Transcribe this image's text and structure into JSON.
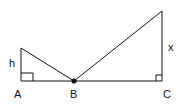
{
  "diagram": {
    "labels": {
      "h": "h",
      "x": "x",
      "A": "A",
      "B": "B",
      "C": "C"
    },
    "points": {
      "A": [
        21,
        81
      ],
      "left_top": [
        21,
        48
      ],
      "B": [
        74,
        81
      ],
      "C": [
        162,
        81
      ],
      "right_top": [
        162,
        11
      ]
    },
    "colors": {
      "stroke": "#111111",
      "background": "#ffffff"
    }
  }
}
